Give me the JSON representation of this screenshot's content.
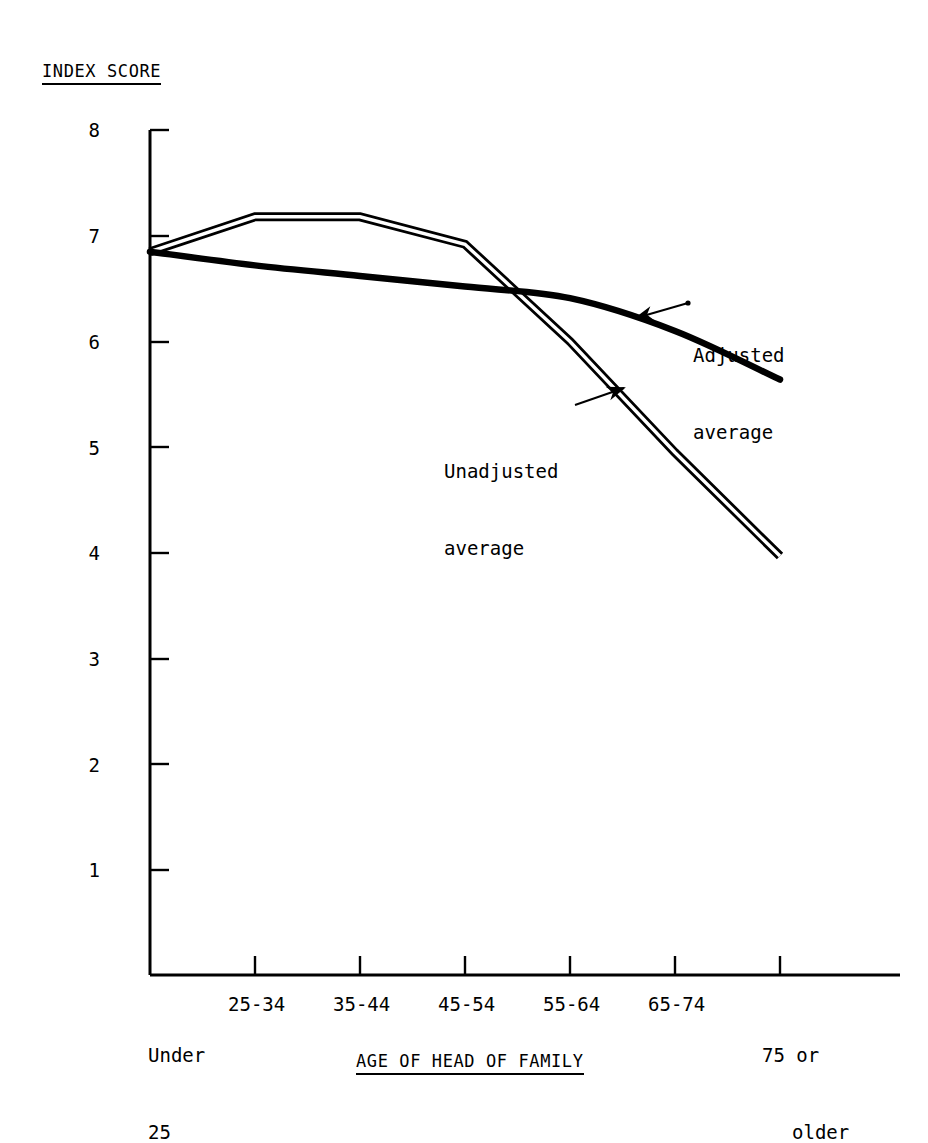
{
  "chart_data": {
    "type": "line",
    "title": "",
    "ylabel": "INDEX SCORE",
    "xlabel": "AGE OF HEAD OF FAMILY",
    "categories": [
      "Under\n25",
      "25-34",
      "35-44",
      "45-54",
      "55-64",
      "65-74",
      "75 or\n    older"
    ],
    "category_plain": [
      "Under 25",
      "25-34",
      "35-44",
      "45-54",
      "55-64",
      "65-74",
      "75 or older"
    ],
    "ylim": [
      0,
      8
    ],
    "yticks": [
      1,
      2,
      3,
      4,
      5,
      6,
      7,
      8
    ],
    "ytick_labels": [
      "1",
      "2",
      "3",
      "4",
      "5",
      "6",
      "7",
      "8"
    ],
    "grid": false,
    "legend_position": "inline-annotations",
    "series": [
      {
        "name": "Unadjusted average",
        "style": "double-line",
        "values": [
          6.85,
          7.18,
          7.18,
          6.92,
          6.0,
          4.95,
          3.97
        ]
      },
      {
        "name": "Adjusted average",
        "style": "thick-smooth-curve",
        "values": [
          6.85,
          6.72,
          6.62,
          6.52,
          6.41,
          6.1,
          5.64
        ]
      }
    ],
    "annotations": [
      {
        "id": "adjusted-annotation",
        "text": "Adjusted\naverage",
        "line1": "Adjusted",
        "line2": "average",
        "arrow_from": [
          688,
          303
        ],
        "arrow_to": [
          636,
          318
        ]
      },
      {
        "id": "unadjusted-annotation",
        "text": "Unadjusted\naverage",
        "line1": "Unadjusted",
        "line2": "average",
        "arrow_from": [
          575,
          405
        ],
        "arrow_to": [
          624,
          388
        ]
      }
    ],
    "colors": {
      "axis": "#000000",
      "unadjusted": "#000000",
      "adjusted": "#000000",
      "background": "#ffffff"
    }
  },
  "axis": {
    "ytick_labels": [
      "8",
      "7",
      "6",
      "5",
      "4",
      "3",
      "2",
      "1"
    ],
    "xtick_labels": [
      {
        "line1": "Under",
        "line2": "25"
      },
      {
        "line1": "25-34",
        "line2": ""
      },
      {
        "line1": "35-44",
        "line2": ""
      },
      {
        "line1": "45-54",
        "line2": ""
      },
      {
        "line1": "55-64",
        "line2": ""
      },
      {
        "line1": "65-74",
        "line2": ""
      },
      {
        "line1": "75 or",
        "line2": "older"
      }
    ]
  },
  "titles": {
    "y_axis_title": "INDEX SCORE",
    "x_axis_title": "AGE OF HEAD OF FAMILY"
  }
}
